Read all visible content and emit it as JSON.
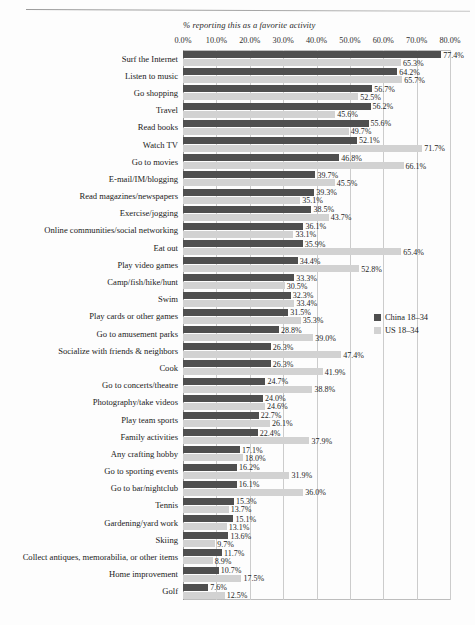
{
  "decor": {
    "top_rule": "horizontal-rule"
  },
  "axis": {
    "title": "% reporting this as a favorite activity",
    "ticks": [
      "0.0%",
      "10.0%",
      "20.0%",
      "30.0%",
      "40.0%",
      "50.0%",
      "60.0%",
      "70.0%",
      "80.0%"
    ]
  },
  "legend": {
    "items": [
      {
        "label": "China 18–34",
        "color": "#4f4f4f",
        "key": "china"
      },
      {
        "label": "US 18–34",
        "color": "#d2d2d2",
        "key": "us"
      }
    ]
  },
  "chart_data": {
    "type": "bar",
    "orientation": "horizontal",
    "title": "",
    "subtitle": "",
    "xlabel": "% reporting this as a favorite activity",
    "ylabel": "",
    "xlim": [
      0,
      80
    ],
    "xticks": [
      0,
      10,
      20,
      30,
      40,
      50,
      60,
      70,
      80
    ],
    "grid": "vertical",
    "legend_position": "middle-right",
    "categories": [
      "Surf the Internet",
      "Listen to music",
      "Go shopping",
      "Travel",
      "Read books",
      "Watch TV",
      "Go to movies",
      "E-mail/IM/blogging",
      "Read magazines/newspapers",
      "Exercise/jogging",
      "Online communities/social networking",
      "Eat out",
      "Play video games",
      "Camp/fish/hike/hunt",
      "Swim",
      "Play cards or other games",
      "Go to amusement parks",
      "Socialize with friends & neighbors",
      "Cook",
      "Go to concerts/theatre",
      "Photography/take videos",
      "Play team sports",
      "Family activities",
      "Any crafting hobby",
      "Go to sporting events",
      "Go to bar/nightclub",
      "Tennis",
      "Gardening/yard work",
      "Skiing",
      "Collect antiques, memorabilia, or other items",
      "Home improvement",
      "Golf"
    ],
    "series": [
      {
        "name": "China 18–34",
        "color": "#4f4f4f",
        "values": [
          77.4,
          64.2,
          56.7,
          56.2,
          55.6,
          52.1,
          46.8,
          39.7,
          39.3,
          38.5,
          36.1,
          35.9,
          34.4,
          33.3,
          32.3,
          31.5,
          28.8,
          26.3,
          26.3,
          24.7,
          24.0,
          22.7,
          22.4,
          17.1,
          16.2,
          16.1,
          15.3,
          15.1,
          13.6,
          11.7,
          10.7,
          7.6
        ],
        "labels": [
          "77.4%",
          "64.2%",
          "56.7%",
          "56.2%",
          "55.6%",
          "52.1%",
          "46.8%",
          "39.7%",
          "39.3%",
          "38.5%",
          "36.1%",
          "35.9%",
          "34.4%",
          "33.3%",
          "32.3%",
          "31.5%",
          "28.8%",
          "26.3%",
          "26.3%",
          "24.7%",
          "24.0%",
          "22.7%",
          "22.4%",
          "17.1%",
          "16.2%",
          "16.1%",
          "15.3%",
          "15.1%",
          "13.6%",
          "11.7%",
          "10.7%",
          "7.6%"
        ]
      },
      {
        "name": "US 18–34",
        "color": "#d2d2d2",
        "values": [
          65.3,
          65.7,
          52.5,
          45.6,
          49.7,
          71.7,
          66.1,
          45.5,
          35.1,
          43.7,
          33.1,
          65.4,
          52.8,
          30.5,
          33.4,
          35.3,
          39.0,
          47.4,
          41.9,
          38.8,
          24.6,
          26.1,
          37.9,
          18.0,
          31.9,
          36.0,
          13.7,
          13.1,
          9.7,
          8.9,
          17.5,
          12.5
        ],
        "labels": [
          "65.3%",
          "65.7%",
          "52.5%",
          "45.6%",
          "49.7%",
          "71.7%",
          "66.1%",
          "45.5%",
          "35.1%",
          "43.7%",
          "33.1%",
          "65.4%",
          "52.8%",
          "30.5%",
          "33.4%",
          "35.3%",
          "39.0%",
          "47.4%",
          "41.9%",
          "38.8%",
          "24.6%",
          "26.1%",
          "37.9%",
          "18.0%",
          "31.9%",
          "36.0%",
          "13.7%",
          "13.1%",
          "9.7%",
          "8.9%",
          "17.5%",
          "12.5%"
        ]
      }
    ]
  }
}
